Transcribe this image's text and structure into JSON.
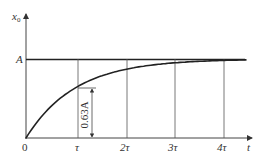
{
  "chart_data": {
    "type": "line",
    "title": "",
    "xlabel": "t",
    "ylabel": "x0",
    "x_ticks": [
      "0",
      "τ",
      "2τ",
      "3τ",
      "4τ"
    ],
    "y_ticks": [
      "A"
    ],
    "annotation": "0.63A",
    "series": [
      {
        "name": "x0(t)",
        "x": [
          0,
          0.5,
          1,
          1.5,
          2,
          2.5,
          3,
          3.5,
          4,
          4.5
        ],
        "values": [
          0,
          0.393,
          0.632,
          0.777,
          0.865,
          0.918,
          0.95,
          0.97,
          0.982,
          0.989
        ]
      },
      {
        "name": "asymptote A",
        "x": [
          0,
          4.5
        ],
        "values": [
          1,
          1
        ]
      }
    ],
    "grid": false,
    "xlim": [
      0,
      4.6
    ],
    "ylim": [
      0,
      1.3
    ]
  },
  "labels": {
    "y_axis": "x",
    "y_axis_sub": "0",
    "x_axis": "t",
    "asymptote": "A",
    "origin": "0",
    "tau1": "τ",
    "tau2": "2τ",
    "tau3": "3τ",
    "tau4": "4τ",
    "dim_value": "0.63A"
  }
}
